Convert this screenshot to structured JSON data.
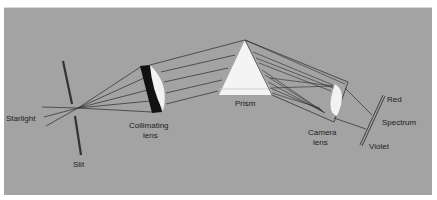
{
  "diagram": {
    "labels": {
      "starlight": "Starlight",
      "slit": "Slit",
      "collimating_lens_line1": "Collimating",
      "collimating_lens_line2": "lens",
      "prism": "Prism",
      "camera_lens_line1": "Camera",
      "camera_lens_line2": "lens",
      "red": "Red",
      "spectrum": "Spectrum",
      "violet": "Violet"
    },
    "colors": {
      "background": "#a3a3a3",
      "lines": "#2a2a2a",
      "prism": "#f4f4f4",
      "lens": "#f2f2f2",
      "lens_shadow": "#111111"
    },
    "components": [
      "Starlight",
      "Slit",
      "Collimating lens",
      "Prism",
      "Camera lens",
      "Spectrum"
    ]
  }
}
